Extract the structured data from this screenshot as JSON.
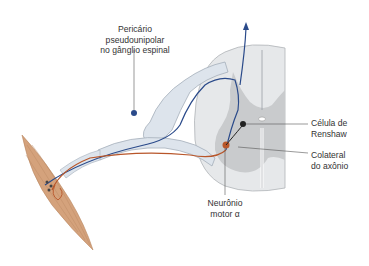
{
  "labels": {
    "pericario": [
      "Pericário",
      "pseudounipolar",
      "no gânglio espinal"
    ],
    "renshaw": [
      "Célula de",
      "Renshaw"
    ],
    "colateral": [
      "Colateral",
      "do axônio"
    ],
    "motor": [
      "Neurônio",
      "motor α"
    ]
  },
  "colors": {
    "sensory_axon": "#2a4a8a",
    "motor_axon": "#b8562a",
    "grey_matter": "#c9cbcd",
    "white_matter": "#e6e8ea",
    "nerve": "#dde4ec",
    "muscle": "#d4a27c",
    "leader": "#555555"
  }
}
